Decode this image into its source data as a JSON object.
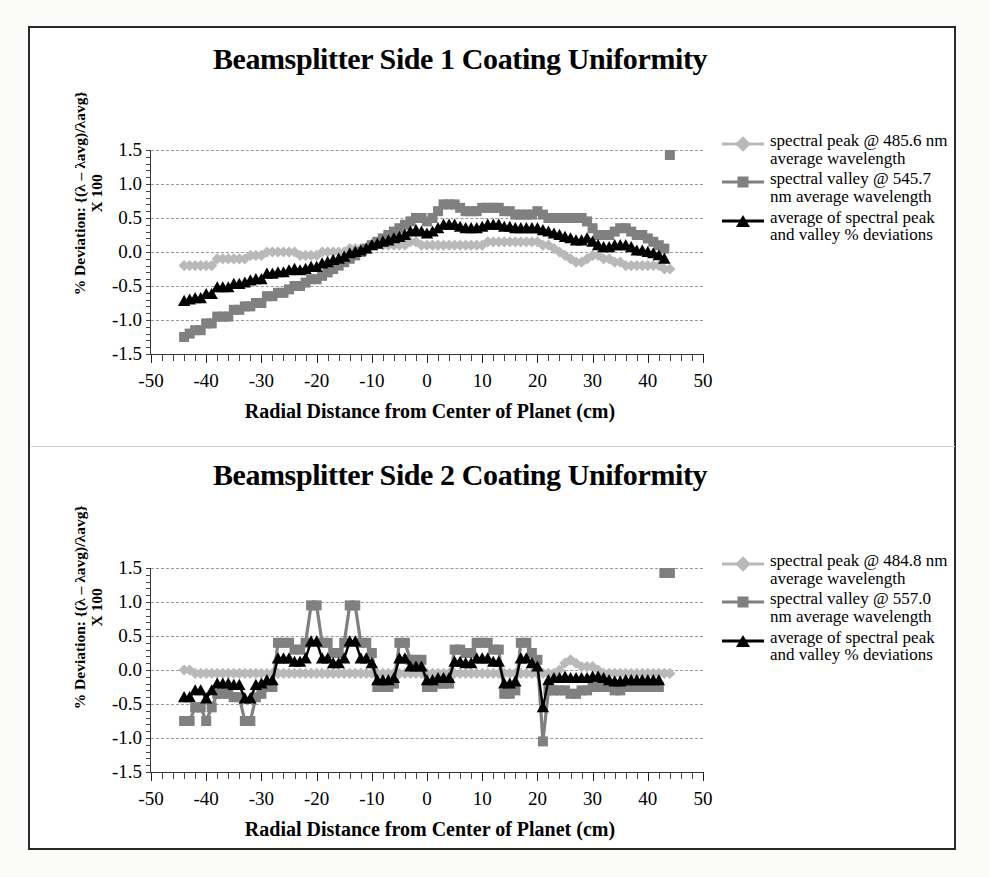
{
  "page": {
    "border_color": "#2a2a2a",
    "background": "#ffffff"
  },
  "colors": {
    "peak": "#b9b9b9",
    "valley": "#808080",
    "average": "#000000",
    "grid": "#9a9a9a",
    "axis": "#333333"
  },
  "charts": [
    {
      "id": "beamsplitter-side-1",
      "title": "Beamsplitter Side 1 Coating Uniformity",
      "ylabel_line1": "% Deviation: {(λ – λavg)/λavg}",
      "ylabel_line2": "X 100",
      "xlabel": "Radial Distance from Center of Planet (cm)",
      "legend": [
        {
          "marker": "diamond",
          "color": "#b9b9b9",
          "label": "spectral peak @ 485.6 nm average wavelength"
        },
        {
          "marker": "square",
          "color": "#808080",
          "label": "spectral valley @ 545.7 nm average wavelength"
        },
        {
          "marker": "triangle",
          "color": "#000000",
          "label": "average of spectral peak and valley % deviations"
        }
      ]
    },
    {
      "id": "beamsplitter-side-2",
      "title": "Beamsplitter Side 2 Coating Uniformity",
      "ylabel_line1": "% Deviation: {(λ – λavg)/λavg}",
      "ylabel_line2": "X 100",
      "xlabel": "Radial Distance from Center of Planet (cm)",
      "legend": [
        {
          "marker": "diamond",
          "color": "#b9b9b9",
          "label": "spectral peak @ 484.8 nm average wavelength"
        },
        {
          "marker": "square",
          "color": "#808080",
          "label": "spectral valley @ 557.0 nm average wavelength"
        },
        {
          "marker": "triangle",
          "color": "#000000",
          "label": "average of spectral peak and valley % deviations"
        }
      ]
    }
  ],
  "chart_data": [
    {
      "type": "line",
      "title": "Beamsplitter Side 1 Coating Uniformity",
      "xlabel": "Radial Distance from Center of Planet (cm)",
      "ylabel": "% Deviation: {(λ – λavg)/λavg} X 100",
      "xlim": [
        -50,
        50
      ],
      "ylim": [
        -1.5,
        1.5
      ],
      "xticks": [
        -50,
        -40,
        -30,
        -20,
        -10,
        0,
        10,
        20,
        30,
        40,
        50
      ],
      "yticks": [
        -1.5,
        -1.0,
        -0.5,
        0.0,
        0.5,
        1.0,
        1.5
      ],
      "grid": true,
      "legend_position": "right",
      "x": [
        -44,
        -43,
        -42,
        -41,
        -40,
        -39,
        -38,
        -37,
        -36,
        -35,
        -34,
        -33,
        -32,
        -31,
        -30,
        -29,
        -28,
        -27,
        -26,
        -25,
        -24,
        -23,
        -22,
        -21,
        -20,
        -19,
        -18,
        -17,
        -16,
        -15,
        -14,
        -13,
        -12,
        -11,
        -10,
        -9,
        -8,
        -7,
        -6,
        -5,
        -4,
        -3,
        -2,
        -1,
        0,
        1,
        2,
        3,
        4,
        5,
        6,
        7,
        8,
        9,
        10,
        11,
        12,
        13,
        14,
        15,
        16,
        17,
        18,
        19,
        20,
        21,
        22,
        23,
        24,
        25,
        26,
        27,
        28,
        29,
        30,
        31,
        32,
        33,
        34,
        35,
        36,
        37,
        38,
        39,
        40,
        41,
        42,
        43,
        44
      ],
      "series": [
        {
          "name": "spectral peak @ 485.6 nm average wavelength",
          "marker": "diamond",
          "color": "#b9b9b9",
          "values": [
            -0.2,
            -0.2,
            -0.2,
            -0.2,
            -0.2,
            -0.2,
            -0.1,
            -0.1,
            -0.1,
            -0.1,
            -0.1,
            -0.1,
            -0.05,
            -0.05,
            -0.05,
            0.0,
            0.0,
            0.0,
            0.0,
            0.0,
            0.0,
            -0.05,
            -0.05,
            -0.05,
            -0.05,
            0.0,
            0.0,
            0.0,
            0.0,
            0.0,
            0.05,
            0.05,
            0.05,
            0.05,
            0.1,
            0.1,
            0.1,
            0.1,
            0.1,
            0.1,
            0.1,
            0.15,
            0.15,
            0.1,
            0.1,
            0.1,
            0.1,
            0.1,
            0.1,
            0.1,
            0.1,
            0.1,
            0.1,
            0.1,
            0.1,
            0.15,
            0.15,
            0.15,
            0.15,
            0.15,
            0.15,
            0.15,
            0.15,
            0.15,
            0.15,
            0.1,
            0.1,
            0.05,
            0.0,
            -0.05,
            -0.1,
            -0.15,
            -0.15,
            -0.1,
            -0.05,
            -0.05,
            -0.1,
            -0.1,
            -0.15,
            -0.15,
            -0.2,
            -0.2,
            -0.2,
            -0.2,
            -0.2,
            -0.2,
            -0.2,
            -0.25,
            -0.25
          ]
        },
        {
          "name": "spectral valley @ 545.7 nm average wavelength",
          "marker": "square",
          "color": "#808080",
          "values": [
            -1.25,
            -1.2,
            -1.15,
            -1.15,
            -1.05,
            -1.05,
            -0.95,
            -0.95,
            -0.95,
            -0.85,
            -0.85,
            -0.8,
            -0.8,
            -0.75,
            -0.75,
            -0.65,
            -0.65,
            -0.6,
            -0.6,
            -0.55,
            -0.5,
            -0.5,
            -0.45,
            -0.4,
            -0.4,
            -0.35,
            -0.3,
            -0.25,
            -0.2,
            -0.15,
            -0.1,
            -0.05,
            0.0,
            0.05,
            0.1,
            0.15,
            0.2,
            0.25,
            0.3,
            0.35,
            0.4,
            0.45,
            0.5,
            0.5,
            0.45,
            0.5,
            0.6,
            0.7,
            0.7,
            0.7,
            0.65,
            0.6,
            0.6,
            0.6,
            0.65,
            0.65,
            0.65,
            0.65,
            0.6,
            0.6,
            0.55,
            0.55,
            0.55,
            0.55,
            0.6,
            0.55,
            0.5,
            0.5,
            0.5,
            0.5,
            0.5,
            0.5,
            0.5,
            0.45,
            0.35,
            0.25,
            0.25,
            0.25,
            0.3,
            0.35,
            0.35,
            0.3,
            0.25,
            0.25,
            0.2,
            0.15,
            0.1,
            0.05
          ]
        },
        {
          "name": "average of spectral peak and valley % deviations",
          "marker": "triangle",
          "color": "#000000",
          "values": [
            -0.72,
            -0.7,
            -0.68,
            -0.68,
            -0.62,
            -0.62,
            -0.52,
            -0.52,
            -0.52,
            -0.47,
            -0.47,
            -0.45,
            -0.42,
            -0.4,
            -0.4,
            -0.32,
            -0.32,
            -0.3,
            -0.3,
            -0.27,
            -0.25,
            -0.27,
            -0.25,
            -0.22,
            -0.22,
            -0.17,
            -0.15,
            -0.12,
            -0.1,
            -0.07,
            -0.02,
            0.0,
            0.02,
            0.05,
            0.1,
            0.12,
            0.15,
            0.17,
            0.2,
            0.22,
            0.25,
            0.3,
            0.32,
            0.3,
            0.27,
            0.3,
            0.35,
            0.4,
            0.4,
            0.4,
            0.37,
            0.35,
            0.35,
            0.35,
            0.37,
            0.4,
            0.4,
            0.4,
            0.37,
            0.37,
            0.35,
            0.35,
            0.35,
            0.35,
            0.35,
            0.32,
            0.3,
            0.27,
            0.25,
            0.22,
            0.2,
            0.17,
            0.17,
            0.2,
            0.15,
            0.1,
            0.07,
            0.07,
            0.1,
            0.1,
            0.1,
            0.07,
            0.02,
            0.02,
            0.0,
            -0.02,
            -0.05,
            -0.1
          ]
        }
      ]
    },
    {
      "type": "line",
      "title": "Beamsplitter Side 2 Coating Uniformity",
      "xlabel": "Radial Distance from Center of Planet (cm)",
      "ylabel": "% Deviation: {(λ – λavg)/λavg} X 100",
      "xlim": [
        -50,
        50
      ],
      "ylim": [
        -1.5,
        1.5
      ],
      "xticks": [
        -50,
        -40,
        -30,
        -20,
        -10,
        0,
        10,
        20,
        30,
        40,
        50
      ],
      "yticks": [
        -1.5,
        -1.0,
        -0.5,
        0.0,
        0.5,
        1.0,
        1.5
      ],
      "grid": true,
      "legend_position": "right",
      "x": [
        -44,
        -43,
        -42,
        -41,
        -40,
        -39,
        -38,
        -37,
        -36,
        -35,
        -34,
        -33,
        -32,
        -31,
        -30,
        -29,
        -28,
        -27,
        -26,
        -25,
        -24,
        -23,
        -22,
        -21,
        -20,
        -19,
        -18,
        -17,
        -16,
        -15,
        -14,
        -13,
        -12,
        -11,
        -10,
        -9,
        -8,
        -7,
        -6,
        -5,
        -4,
        -3,
        -2,
        -1,
        0,
        1,
        2,
        3,
        4,
        5,
        6,
        7,
        8,
        9,
        10,
        11,
        12,
        13,
        14,
        15,
        16,
        17,
        18,
        19,
        20,
        21,
        22,
        23,
        24,
        25,
        26,
        27,
        28,
        29,
        30,
        31,
        32,
        33,
        34,
        35,
        36,
        37,
        38,
        39,
        40,
        41,
        42,
        43,
        44
      ],
      "series": [
        {
          "name": "spectral peak @ 484.8 nm average wavelength",
          "marker": "diamond",
          "color": "#b9b9b9",
          "values": [
            0.0,
            0.0,
            -0.05,
            -0.05,
            -0.05,
            -0.05,
            -0.05,
            -0.05,
            -0.05,
            -0.05,
            -0.05,
            -0.05,
            -0.05,
            -0.05,
            -0.05,
            -0.05,
            -0.05,
            -0.05,
            -0.05,
            -0.05,
            -0.05,
            -0.05,
            -0.05,
            -0.05,
            -0.05,
            -0.05,
            -0.05,
            -0.05,
            -0.05,
            -0.05,
            -0.05,
            -0.05,
            -0.05,
            -0.05,
            -0.05,
            -0.05,
            -0.05,
            -0.05,
            -0.05,
            -0.05,
            -0.05,
            -0.05,
            -0.05,
            -0.05,
            -0.05,
            -0.05,
            -0.05,
            -0.05,
            -0.05,
            -0.05,
            -0.05,
            -0.05,
            -0.05,
            -0.05,
            -0.05,
            -0.05,
            -0.05,
            -0.05,
            -0.05,
            -0.05,
            -0.05,
            -0.05,
            -0.05,
            -0.05,
            -0.05,
            -0.05,
            -0.05,
            -0.05,
            0.0,
            0.1,
            0.15,
            0.1,
            0.05,
            0.05,
            0.05,
            0.0,
            -0.05,
            -0.05,
            -0.05,
            -0.05,
            -0.05,
            -0.05,
            -0.05,
            -0.05,
            -0.05,
            -0.05,
            -0.05,
            -0.05,
            -0.05
          ]
        },
        {
          "name": "spectral valley @ 557.0 nm average wavelength",
          "marker": "square",
          "color": "#808080",
          "values": [
            -0.75,
            -0.75,
            -0.55,
            -0.55,
            -0.75,
            -0.55,
            -0.35,
            -0.35,
            -0.35,
            -0.4,
            -0.4,
            -0.75,
            -0.75,
            -0.4,
            -0.35,
            -0.25,
            -0.25,
            0.4,
            0.4,
            0.4,
            0.3,
            0.3,
            0.4,
            0.95,
            0.95,
            0.4,
            0.4,
            0.25,
            0.25,
            0.4,
            0.95,
            0.95,
            0.4,
            0.4,
            0.25,
            -0.25,
            -0.25,
            -0.25,
            -0.2,
            0.4,
            0.4,
            0.15,
            0.15,
            0.15,
            -0.25,
            -0.25,
            -0.2,
            -0.2,
            -0.2,
            0.3,
            0.3,
            0.25,
            0.25,
            0.4,
            0.4,
            0.4,
            0.3,
            0.3,
            -0.35,
            -0.35,
            -0.3,
            0.4,
            0.4,
            0.25,
            0.15,
            -1.05,
            -0.3,
            -0.3,
            -0.3,
            -0.3,
            -0.35,
            -0.35,
            -0.3,
            -0.3,
            -0.25,
            -0.25,
            -0.25,
            -0.25,
            -0.3,
            -0.3,
            -0.25,
            -0.25,
            -0.25,
            -0.25,
            -0.25,
            -0.25,
            -0.25
          ]
        },
        {
          "name": "average of spectral peak and valley % deviations",
          "marker": "triangle",
          "color": "#000000",
          "values": [
            -0.4,
            -0.4,
            -0.3,
            -0.3,
            -0.42,
            -0.3,
            -0.2,
            -0.2,
            -0.2,
            -0.22,
            -0.22,
            -0.42,
            -0.42,
            -0.22,
            -0.2,
            -0.15,
            -0.15,
            0.17,
            0.17,
            0.17,
            0.12,
            0.12,
            0.17,
            0.42,
            0.42,
            0.17,
            0.17,
            0.1,
            0.1,
            0.17,
            0.42,
            0.42,
            0.17,
            0.17,
            0.1,
            -0.15,
            -0.15,
            -0.15,
            -0.12,
            0.17,
            0.17,
            0.05,
            0.05,
            0.05,
            -0.15,
            -0.15,
            -0.12,
            -0.12,
            -0.12,
            0.12,
            0.12,
            0.1,
            0.1,
            0.17,
            0.17,
            0.17,
            0.12,
            0.12,
            -0.2,
            -0.2,
            -0.17,
            0.17,
            0.17,
            0.1,
            0.05,
            -0.55,
            -0.15,
            -0.12,
            -0.12,
            -0.1,
            -0.12,
            -0.12,
            -0.12,
            -0.12,
            -0.1,
            -0.1,
            -0.12,
            -0.15,
            -0.17,
            -0.17,
            -0.15,
            -0.15,
            -0.15,
            -0.15,
            -0.15,
            -0.15,
            -0.15
          ]
        }
      ]
    }
  ]
}
